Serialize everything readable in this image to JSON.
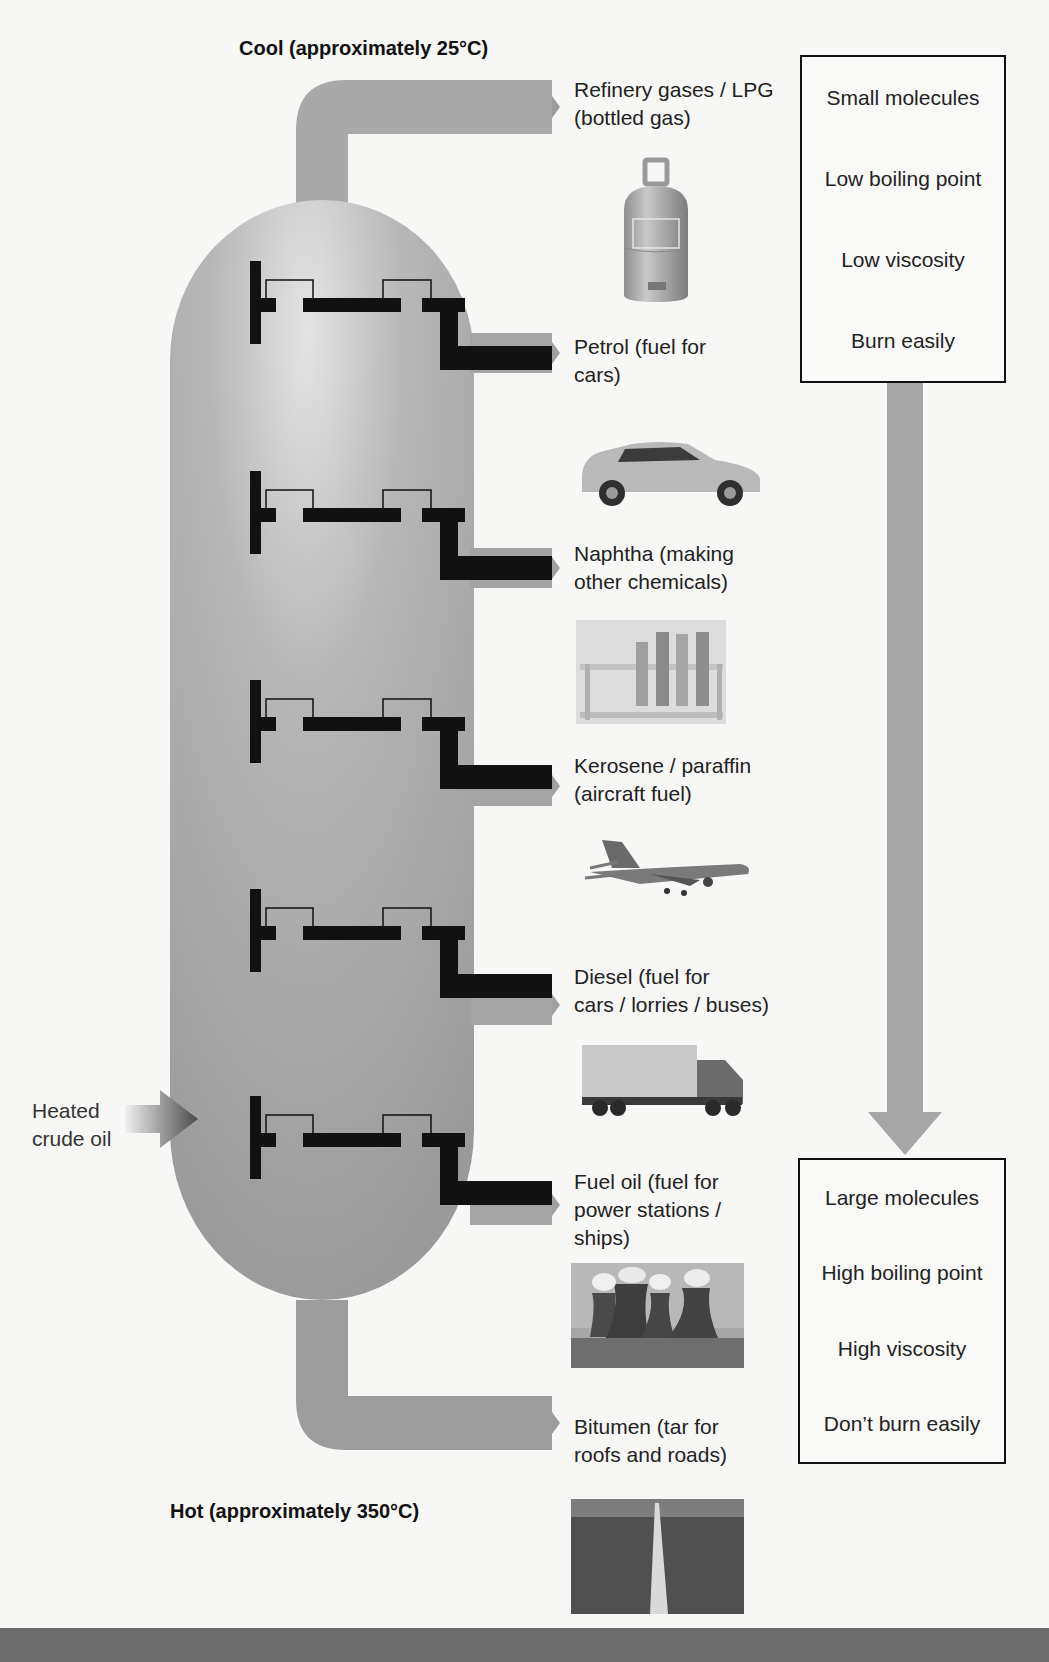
{
  "diagram": {
    "title_top": "Cool (approximately 25°C)",
    "title_bottom": "Hot (approximately 350°C)",
    "input": {
      "label_line1": "Heated",
      "label_line2": "crude oil",
      "icon": "gradient-arrow-right-icon"
    },
    "fractions": [
      {
        "name": "Refinery gases / LPG",
        "line1": "Refinery gases / LPG",
        "line2": "(bottled gas)",
        "line3": "",
        "image": "gas-bottle-icon"
      },
      {
        "name": "Petrol",
        "line1": "Petrol (fuel for",
        "line2": "cars)",
        "line3": "",
        "image": "car-icon"
      },
      {
        "name": "Naphtha",
        "line1": "Naphtha (making",
        "line2": "other chemicals)",
        "line3": "",
        "image": "test-tubes-icon"
      },
      {
        "name": "Kerosene / paraffin",
        "line1": "Kerosene / paraffin",
        "line2": "(aircraft fuel)",
        "line3": "",
        "image": "airplane-icon"
      },
      {
        "name": "Diesel",
        "line1": "Diesel (fuel for",
        "line2": "cars / lorries / buses)",
        "line3": "",
        "image": "lorry-icon"
      },
      {
        "name": "Fuel oil",
        "line1": "Fuel oil (fuel for",
        "line2": "power stations /",
        "line3": "ships)",
        "image": "power-station-icon"
      },
      {
        "name": "Bitumen",
        "line1": "Bitumen (tar for",
        "line2": "roofs and roads)",
        "line3": "",
        "image": "road-icon"
      }
    ],
    "top_properties": [
      "Small molecules",
      "Low boiling point",
      "Low viscosity",
      "Burn easily"
    ],
    "bottom_properties": [
      "Large molecules",
      "High boiling point",
      "High viscosity",
      "Don’t burn easily"
    ],
    "colors": {
      "column": "#a3a3a3",
      "tray": "#111111",
      "pipe": "#a0a0a0",
      "arrow": "#a8a8a8",
      "footer": "#6c6c6c"
    }
  }
}
